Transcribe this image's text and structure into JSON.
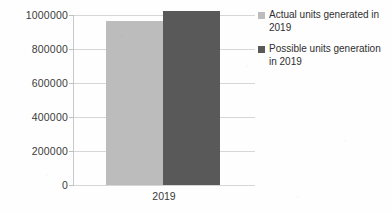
{
  "chart_data": {
    "type": "bar",
    "title": "",
    "xlabel": "",
    "ylabel": "",
    "categories": [
      "2019"
    ],
    "series": [
      {
        "name": "Actual units  generated in 2019",
        "values": [
          965000
        ],
        "color": "#bcbcbc"
      },
      {
        "name": "Possible units generation in 2019",
        "values": [
          1025000
        ],
        "color": "#595959"
      }
    ],
    "ylim": [
      0,
      1000000
    ],
    "yticks": [
      0,
      200000,
      400000,
      600000,
      800000,
      1000000
    ],
    "ytick_labels": [
      "0",
      "200000",
      "400000",
      "600000",
      "800000",
      "1000000"
    ],
    "grid": true,
    "legend_position": "right"
  },
  "legend": {
    "items": [
      {
        "label": "Actual units  generated in 2019",
        "swatch": "legend-swatch-actual"
      },
      {
        "label": "Possible units generation in 2019",
        "swatch": "legend-swatch-possible"
      }
    ]
  },
  "axis": {
    "category_label": "2019"
  }
}
